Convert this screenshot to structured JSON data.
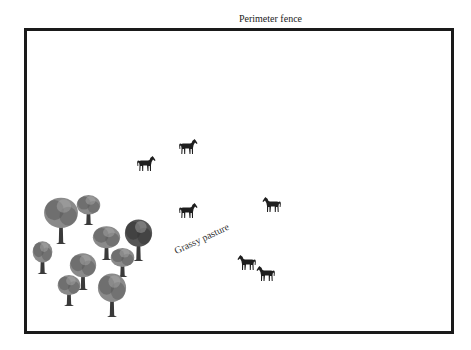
{
  "labels": {
    "fence": "Perimeter fence",
    "pasture": "Grassy pasture"
  },
  "colors": {
    "fence": "#1a1a1a",
    "horse": "#1e1e1e",
    "tree_canopy_light": "#8a8a8a",
    "tree_canopy_dark": "#5a5a5a",
    "tree_trunk": "#3a3a3a"
  },
  "fence": {
    "x": 24,
    "y": 28,
    "width": 427,
    "height": 303
  },
  "horses": [
    {
      "id": "horse-1",
      "x": 136,
      "y": 155,
      "facing": "right"
    },
    {
      "id": "horse-2",
      "x": 178,
      "y": 138,
      "facing": "right"
    },
    {
      "id": "horse-3",
      "x": 178,
      "y": 202,
      "facing": "right"
    },
    {
      "id": "horse-4",
      "x": 262,
      "y": 196,
      "facing": "left"
    },
    {
      "id": "horse-5",
      "x": 237,
      "y": 254,
      "facing": "left"
    },
    {
      "id": "horse-6",
      "x": 256,
      "y": 265,
      "facing": "left"
    }
  ],
  "trees": [
    {
      "id": "tree-1",
      "x": 43,
      "y": 196,
      "w": 36,
      "h": 48
    },
    {
      "id": "tree-2",
      "x": 76,
      "y": 194,
      "w": 25,
      "h": 31
    },
    {
      "id": "tree-3",
      "x": 92,
      "y": 225,
      "w": 29,
      "h": 35
    },
    {
      "id": "tree-4",
      "x": 124,
      "y": 218,
      "w": 29,
      "h": 43,
      "dark": true
    },
    {
      "id": "tree-5",
      "x": 32,
      "y": 240,
      "w": 21,
      "h": 34
    },
    {
      "id": "tree-6",
      "x": 110,
      "y": 247,
      "w": 25,
      "h": 30
    },
    {
      "id": "tree-7",
      "x": 69,
      "y": 252,
      "w": 28,
      "h": 38
    },
    {
      "id": "tree-8",
      "x": 57,
      "y": 274,
      "w": 24,
      "h": 32
    },
    {
      "id": "tree-9",
      "x": 97,
      "y": 272,
      "w": 30,
      "h": 45
    }
  ]
}
